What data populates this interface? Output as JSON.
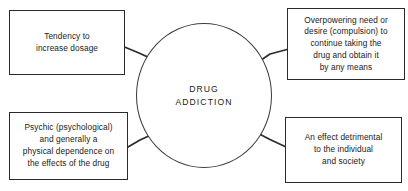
{
  "diagram": {
    "title": "DRUG\nADDICTION",
    "type": "hub-and-spoke concept diagram",
    "center": {
      "label": "DRUG\nADDICTION",
      "shape": "circle"
    },
    "nodes": [
      {
        "id": "top-left",
        "label": "Tendency to\nincrease dosage",
        "shape": "rectangle"
      },
      {
        "id": "top-right",
        "label": "Overpowering need or\ndesire (compulsion) to\ncontinue taking the\ndrug and obtain it\nby any means",
        "shape": "rectangle"
      },
      {
        "id": "bottom-left",
        "label": "Psychic (psychological)\nand generally a\nphysical dependence on\nthe effects of the drug",
        "shape": "rectangle"
      },
      {
        "id": "bottom-right",
        "label": "An effect detrimental\nto the individual\nand society",
        "shape": "rectangle"
      }
    ],
    "connectors": [
      {
        "id": "connector-top-left",
        "from": "top-left",
        "to": "center"
      },
      {
        "id": "connector-top-right",
        "from": "center",
        "to": "top-right"
      },
      {
        "id": "connector-bottom-left",
        "from": "bottom-left",
        "to": "center"
      },
      {
        "id": "connector-bottom-right",
        "from": "center",
        "to": "bottom-right"
      }
    ],
    "colors": {
      "background": "#ffffff",
      "stroke": "#2b2b2b",
      "circle_stroke": "#3a3a3a",
      "text": "#1a1a1a"
    }
  }
}
